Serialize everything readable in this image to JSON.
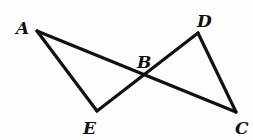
{
  "diagram": {
    "type": "geometry",
    "points": {
      "A": {
        "label": "A",
        "x": 37,
        "y": 31,
        "label_x": 16,
        "label_y": 34
      },
      "B": {
        "label": "B",
        "x": 144,
        "y": 77,
        "label_x": 137,
        "label_y": 68
      },
      "C": {
        "label": "C",
        "x": 236,
        "y": 112,
        "label_x": 236,
        "label_y": 134
      },
      "D": {
        "label": "D",
        "x": 198,
        "y": 33,
        "label_x": 197,
        "label_y": 26
      },
      "E": {
        "label": "E",
        "x": 97,
        "y": 111,
        "label_x": 83,
        "label_y": 134
      }
    },
    "segments": [
      {
        "from": "A",
        "to": "C"
      },
      {
        "from": "E",
        "to": "D"
      },
      {
        "from": "A",
        "to": "E"
      },
      {
        "from": "D",
        "to": "C"
      }
    ],
    "stroke_color": "#111111"
  }
}
